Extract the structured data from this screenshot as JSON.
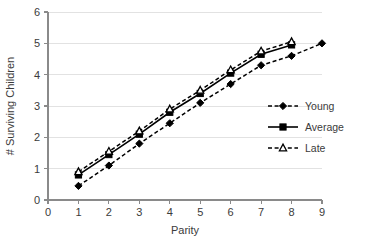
{
  "chart_data": {
    "type": "line",
    "title": "",
    "xlabel": "Parity",
    "ylabel": "# Surviving Children",
    "xlim": [
      0,
      9
    ],
    "ylim": [
      0,
      6
    ],
    "xticks": [
      "0",
      "1",
      "2",
      "3",
      "4",
      "5",
      "6",
      "7",
      "8",
      "9"
    ],
    "yticks": [
      "0",
      "1",
      "2",
      "3",
      "4",
      "5",
      "6"
    ],
    "grid": "horizontal",
    "legend_position": "right-middle",
    "series": [
      {
        "name": "Young",
        "line_style": "dashed",
        "marker": "filled-diamond",
        "color": "#000000",
        "x": [
          1,
          2,
          3,
          4,
          5,
          6,
          7,
          8,
          9
        ],
        "values": [
          0.45,
          1.1,
          1.8,
          2.45,
          3.1,
          3.7,
          4.3,
          4.6,
          5.0
        ]
      },
      {
        "name": "Average",
        "line_style": "solid",
        "marker": "filled-square",
        "color": "#000000",
        "x": [
          1,
          2,
          3,
          4,
          5,
          6,
          7,
          8
        ],
        "values": [
          0.8,
          1.45,
          2.1,
          2.8,
          3.4,
          4.05,
          4.65,
          4.95
        ]
      },
      {
        "name": "Late",
        "line_style": "dashed",
        "marker": "open-triangle",
        "color": "#000000",
        "x": [
          1,
          2,
          3,
          4,
          5,
          6,
          7,
          8
        ],
        "values": [
          0.9,
          1.55,
          2.2,
          2.9,
          3.5,
          4.15,
          4.75,
          5.05
        ]
      }
    ]
  },
  "legend": {
    "items": [
      {
        "label": "Young"
      },
      {
        "label": "Average"
      },
      {
        "label": "Late"
      }
    ]
  },
  "axes": {
    "x_title": "Parity",
    "y_title": "# Surviving Children"
  }
}
